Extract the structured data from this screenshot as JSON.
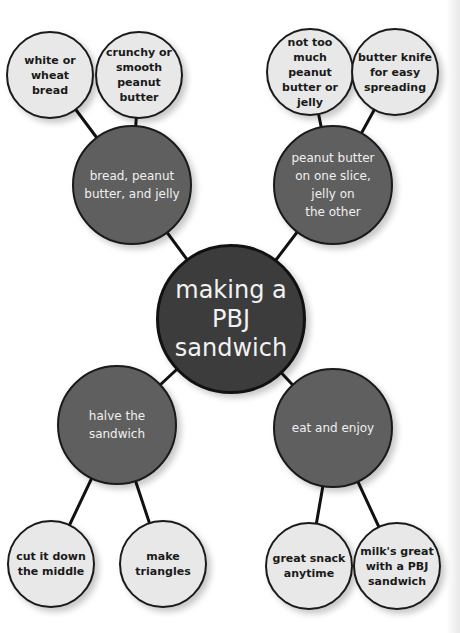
{
  "diagram": {
    "type": "mind-map",
    "center": {
      "label": "making a\nPBJ\nsandwich"
    },
    "branches": [
      {
        "label": "bread, peanut\nbutter, and jelly",
        "children": [
          {
            "label": "white or\nwheat bread"
          },
          {
            "label": "crunchy or\nsmooth peanut\nbutter"
          }
        ]
      },
      {
        "label": "peanut butter\non one slice,\njelly on\nthe other",
        "children": [
          {
            "label": "not too\nmuch peanut\nbutter or jelly"
          },
          {
            "label": "butter knife\nfor easy\nspreading"
          }
        ]
      },
      {
        "label": "halve the\nsandwich",
        "children": [
          {
            "label": "cut it down\nthe middle"
          },
          {
            "label": "make triangles"
          }
        ]
      },
      {
        "label": "eat and enjoy",
        "children": [
          {
            "label": "great snack\nanytime"
          },
          {
            "label": "milk's great\nwith a PBJ\nsandwich"
          }
        ]
      }
    ],
    "colors": {
      "center_fill": "#3c3c3c",
      "branch_fill": "#5f5f5f",
      "leaf_fill": "#e8e8e8",
      "outline": "#1a1a1a"
    }
  }
}
